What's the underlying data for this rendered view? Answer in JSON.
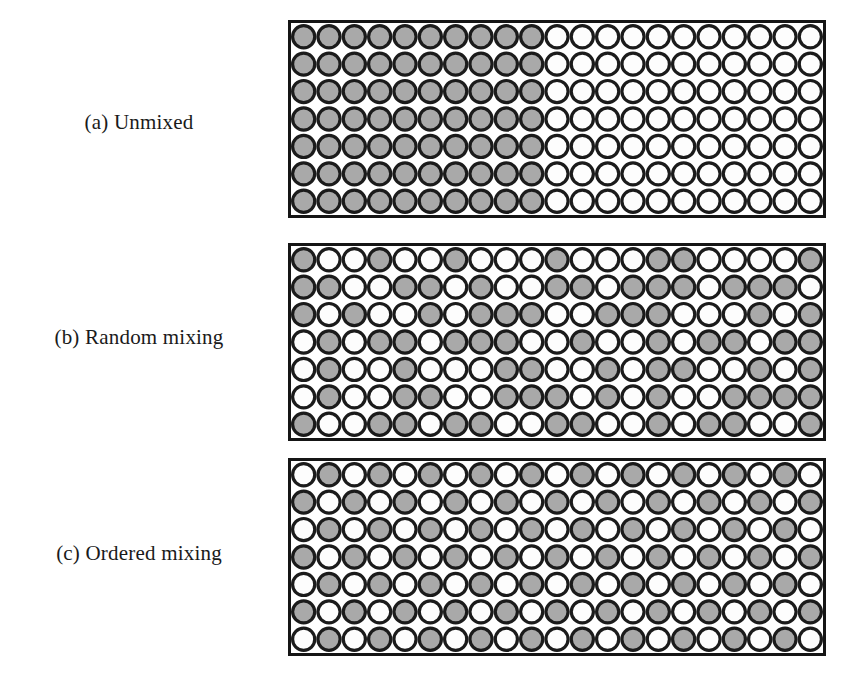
{
  "figure": {
    "kind": "particle-packing-diagram",
    "background_color": "#ffffff",
    "panel_left": 288,
    "panel_width": 538,
    "panel_height": 198,
    "grid_rows": 7,
    "grid_cols": 21,
    "colors": {
      "particle_gray": "#a9a9a9",
      "particle_white": "#fdfdfd",
      "outline": "#1b1b1b",
      "frame": "#151515",
      "text": "#1a1a1a"
    },
    "outline_width": 3.2,
    "frame_width": 3.0
  },
  "panels": [
    {
      "id": "a",
      "label": "(a) Unmixed",
      "label_y": 110,
      "box_top": 20,
      "description": "segregated: gray particles fill the left portion, white particles the right portion",
      "split_column": 10,
      "grid": [
        [
          1,
          1,
          1,
          1,
          1,
          1,
          1,
          1,
          1,
          1,
          0,
          0,
          0,
          0,
          0,
          0,
          0,
          0,
          0,
          0,
          0
        ],
        [
          1,
          1,
          1,
          1,
          1,
          1,
          1,
          1,
          1,
          1,
          0,
          0,
          0,
          0,
          0,
          0,
          0,
          0,
          0,
          0,
          0
        ],
        [
          1,
          1,
          1,
          1,
          1,
          1,
          1,
          1,
          1,
          1,
          0,
          0,
          0,
          0,
          0,
          0,
          0,
          0,
          0,
          0,
          0
        ],
        [
          1,
          1,
          1,
          1,
          1,
          1,
          1,
          1,
          1,
          1,
          0,
          0,
          0,
          0,
          0,
          0,
          0,
          0,
          0,
          0,
          0
        ],
        [
          1,
          1,
          1,
          1,
          1,
          1,
          1,
          1,
          1,
          1,
          0,
          0,
          0,
          0,
          0,
          0,
          0,
          0,
          0,
          0,
          0
        ],
        [
          1,
          1,
          1,
          1,
          1,
          1,
          1,
          1,
          1,
          1,
          0,
          0,
          0,
          0,
          0,
          0,
          0,
          0,
          0,
          0,
          0
        ],
        [
          1,
          1,
          1,
          1,
          1,
          1,
          1,
          1,
          1,
          1,
          0,
          0,
          0,
          0,
          0,
          0,
          0,
          0,
          0,
          0,
          0
        ]
      ]
    },
    {
      "id": "b",
      "label": "(b) Random mixing",
      "label_y": 325,
      "box_top": 243,
      "description": "random mixing: gray and white particles randomly distributed",
      "grid": [
        [
          1,
          0,
          0,
          1,
          0,
          0,
          1,
          0,
          0,
          0,
          1,
          0,
          0,
          0,
          1,
          1,
          0,
          0,
          0,
          0,
          1
        ],
        [
          1,
          1,
          0,
          0,
          1,
          1,
          0,
          1,
          0,
          0,
          1,
          1,
          0,
          1,
          1,
          1,
          0,
          1,
          1,
          1,
          0
        ],
        [
          1,
          0,
          1,
          0,
          0,
          1,
          0,
          1,
          1,
          1,
          0,
          0,
          1,
          1,
          1,
          0,
          0,
          0,
          1,
          0,
          1
        ],
        [
          0,
          1,
          0,
          1,
          1,
          0,
          1,
          1,
          1,
          0,
          0,
          1,
          0,
          0,
          1,
          0,
          1,
          1,
          0,
          1,
          1
        ],
        [
          0,
          1,
          0,
          0,
          1,
          0,
          0,
          0,
          1,
          1,
          0,
          0,
          1,
          0,
          1,
          1,
          0,
          0,
          1,
          0,
          1
        ],
        [
          0,
          1,
          0,
          0,
          1,
          1,
          0,
          0,
          1,
          1,
          1,
          0,
          1,
          0,
          1,
          0,
          0,
          1,
          1,
          1,
          1
        ],
        [
          1,
          0,
          0,
          1,
          1,
          0,
          1,
          1,
          0,
          0,
          1,
          1,
          0,
          0,
          1,
          0,
          1,
          1,
          0,
          0,
          1
        ]
      ]
    },
    {
      "id": "c",
      "label": "(c) Ordered mixing",
      "label_y": 541,
      "box_top": 458,
      "description": "ordered mixing: perfect alternating checkerboard of gray and white particles",
      "grid": [
        [
          0,
          1,
          0,
          1,
          0,
          1,
          0,
          1,
          0,
          1,
          0,
          1,
          0,
          1,
          0,
          1,
          0,
          1,
          0,
          1,
          0
        ],
        [
          1,
          0,
          1,
          0,
          1,
          0,
          1,
          0,
          1,
          0,
          1,
          0,
          1,
          0,
          1,
          0,
          1,
          0,
          1,
          0,
          1
        ],
        [
          0,
          1,
          0,
          1,
          0,
          1,
          0,
          1,
          0,
          1,
          0,
          1,
          0,
          1,
          0,
          1,
          0,
          1,
          0,
          1,
          0
        ],
        [
          1,
          0,
          1,
          0,
          1,
          0,
          1,
          0,
          1,
          0,
          1,
          0,
          1,
          0,
          1,
          0,
          1,
          0,
          1,
          0,
          1
        ],
        [
          0,
          1,
          0,
          1,
          0,
          1,
          0,
          1,
          0,
          1,
          0,
          1,
          0,
          1,
          0,
          1,
          0,
          1,
          0,
          1,
          0
        ],
        [
          1,
          0,
          1,
          0,
          1,
          0,
          1,
          0,
          1,
          0,
          1,
          0,
          1,
          0,
          1,
          0,
          1,
          0,
          1,
          0,
          1
        ],
        [
          0,
          1,
          0,
          1,
          0,
          1,
          0,
          1,
          0,
          1,
          0,
          1,
          0,
          1,
          0,
          1,
          0,
          1,
          0,
          1,
          0
        ]
      ]
    }
  ]
}
